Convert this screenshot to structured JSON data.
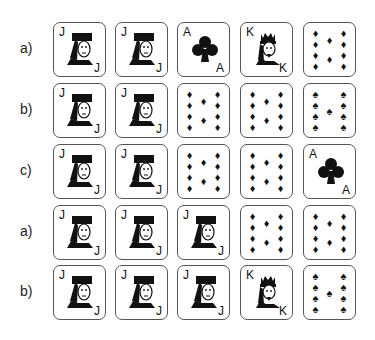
{
  "rows": [
    {
      "label": "a)",
      "cards": [
        {
          "type": "face",
          "rank": "J",
          "suit": "hearts"
        },
        {
          "type": "face",
          "rank": "J",
          "suit": "hearts"
        },
        {
          "type": "ace",
          "rank": "A",
          "suit": "clubs"
        },
        {
          "type": "face",
          "rank": "K",
          "suit": "hearts"
        },
        {
          "type": "pips",
          "rank": "10",
          "suit": "diamonds"
        }
      ]
    },
    {
      "label": "b)",
      "cards": [
        {
          "type": "face",
          "rank": "J",
          "suit": "hearts"
        },
        {
          "type": "face",
          "rank": "J",
          "suit": "hearts"
        },
        {
          "type": "pips",
          "rank": "10",
          "suit": "diamonds"
        },
        {
          "type": "pips",
          "rank": "10",
          "suit": "diamonds"
        },
        {
          "type": "pips",
          "rank": "9",
          "suit": "spades"
        }
      ]
    },
    {
      "label": "c)",
      "cards": [
        {
          "type": "face",
          "rank": "J",
          "suit": "hearts"
        },
        {
          "type": "face",
          "rank": "J",
          "suit": "hearts"
        },
        {
          "type": "pips",
          "rank": "10",
          "suit": "diamonds"
        },
        {
          "type": "pips",
          "rank": "10",
          "suit": "diamonds"
        },
        {
          "type": "ace",
          "rank": "A",
          "suit": "clubs"
        }
      ]
    },
    {
      "label": "a)",
      "cards": [
        {
          "type": "face",
          "rank": "J",
          "suit": "hearts"
        },
        {
          "type": "face",
          "rank": "J",
          "suit": "hearts"
        },
        {
          "type": "face",
          "rank": "J",
          "suit": "hearts"
        },
        {
          "type": "pips",
          "rank": "10",
          "suit": "diamonds"
        },
        {
          "type": "pips",
          "rank": "10",
          "suit": "diamonds"
        }
      ]
    },
    {
      "label": "b)",
      "cards": [
        {
          "type": "face",
          "rank": "J",
          "suit": "hearts"
        },
        {
          "type": "face",
          "rank": "J",
          "suit": "hearts"
        },
        {
          "type": "face",
          "rank": "J",
          "suit": "hearts"
        },
        {
          "type": "face",
          "rank": "K",
          "suit": "hearts"
        },
        {
          "type": "pips",
          "rank": "9",
          "suit": "spades"
        }
      ]
    }
  ],
  "layout": {
    "row_tops": [
      22,
      83,
      144,
      205,
      265
    ],
    "col_lefts": [
      53,
      115,
      177,
      240,
      303
    ]
  },
  "suit_glyphs": {
    "diamonds": "♦",
    "spades": "♠",
    "clubs": "♣",
    "hearts": "♥"
  }
}
